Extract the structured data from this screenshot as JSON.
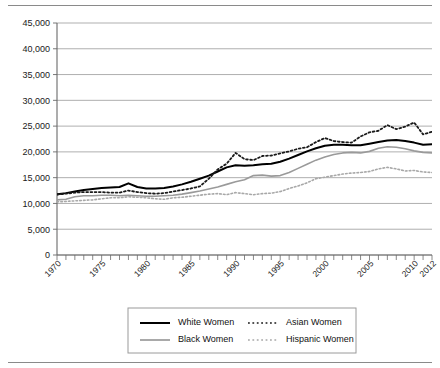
{
  "figure": {
    "background": "#ffffff",
    "has_top_rule": true,
    "has_bottom_rule": true,
    "rule_color": "#8a8a8a"
  },
  "chart_data": {
    "type": "line",
    "title": "",
    "subtitle": "",
    "xlabel": "",
    "ylabel": "",
    "xlim": [
      1970,
      2012
    ],
    "ylim": [
      0,
      45000
    ],
    "grid": true,
    "grid_axis": "y",
    "legend_position": "bottom",
    "yticks": [
      0,
      5000,
      10000,
      15000,
      20000,
      25000,
      30000,
      35000,
      40000,
      45000
    ],
    "ytick_labels": [
      "0",
      "5,000",
      "10,000",
      "15,000",
      "20,000",
      "25,000",
      "30,000",
      "35,000",
      "40,000",
      "45,000"
    ],
    "xticks": [
      1970,
      1975,
      1980,
      1985,
      1990,
      1995,
      2000,
      2005,
      2010,
      2012
    ],
    "xtick_labels": [
      "1970",
      "1975",
      "1980",
      "1985",
      "1990",
      "1995",
      "2000",
      "2005",
      "2010",
      "2012"
    ],
    "x": [
      1970,
      1971,
      1972,
      1973,
      1974,
      1975,
      1976,
      1977,
      1978,
      1979,
      1980,
      1981,
      1982,
      1983,
      1984,
      1985,
      1986,
      1987,
      1988,
      1989,
      1990,
      1991,
      1992,
      1993,
      1994,
      1995,
      1996,
      1997,
      1998,
      1999,
      2000,
      2001,
      2002,
      2003,
      2004,
      2005,
      2006,
      2007,
      2008,
      2009,
      2010,
      2011,
      2012
    ],
    "series": [
      {
        "name": "White Women",
        "color": "#000000",
        "style": "solid",
        "width": 2.0,
        "values": [
          11800,
          12000,
          12300,
          12600,
          12800,
          13000,
          13100,
          13200,
          13900,
          13200,
          12900,
          12900,
          13000,
          13300,
          13700,
          14200,
          14800,
          15400,
          16200,
          17000,
          17400,
          17300,
          17400,
          17600,
          17700,
          18100,
          18700,
          19400,
          20100,
          20700,
          21200,
          21400,
          21400,
          21300,
          21300,
          21600,
          21900,
          22200,
          22300,
          22100,
          21800,
          21400,
          21500
        ]
      },
      {
        "name": "Black Women",
        "color": "#9a9a9a",
        "style": "solid",
        "width": 1.6,
        "values": [
          10700,
          10800,
          11300,
          11500,
          11500,
          11600,
          11600,
          11500,
          11600,
          11500,
          11400,
          11400,
          11500,
          11600,
          11800,
          12100,
          12400,
          12800,
          13200,
          13700,
          14200,
          14600,
          15400,
          15500,
          15300,
          15400,
          16000,
          16800,
          17600,
          18400,
          19000,
          19500,
          19800,
          19900,
          19800,
          20100,
          20700,
          21000,
          20900,
          20600,
          20200,
          19900,
          19800
        ]
      },
      {
        "name": "Asian Women",
        "color": "#1a1a1a",
        "style": "dotted",
        "width": 1.8,
        "values": [
          11700,
          11900,
          12100,
          12200,
          12200,
          12200,
          12100,
          12100,
          12500,
          12200,
          12000,
          11900,
          12000,
          12300,
          12600,
          12900,
          13300,
          14800,
          16600,
          17700,
          19800,
          18600,
          18400,
          19200,
          19300,
          19700,
          20100,
          20600,
          20900,
          21900,
          22700,
          22100,
          21900,
          21800,
          23000,
          23800,
          24100,
          25200,
          24400,
          24900,
          25700,
          23400,
          23900
        ]
      },
      {
        "name": "Hispanic Women",
        "color": "#a8a8a8",
        "style": "dotted",
        "width": 1.6,
        "values": [
          10300,
          10400,
          10500,
          10600,
          10700,
          10900,
          11100,
          11100,
          11300,
          11200,
          11100,
          10900,
          10800,
          11100,
          11200,
          11400,
          11600,
          11800,
          11900,
          11700,
          12100,
          11900,
          11700,
          11900,
          12000,
          12300,
          12900,
          13400,
          14000,
          14800,
          15100,
          15400,
          15700,
          15900,
          16000,
          16200,
          16700,
          17000,
          16700,
          16300,
          16400,
          16100,
          16000
        ]
      }
    ]
  },
  "legend": {
    "entries": [
      {
        "label": "White Women",
        "color": "#000000",
        "style": "solid"
      },
      {
        "label": "Asian Women",
        "color": "#1a1a1a",
        "style": "dotted"
      },
      {
        "label": "Black Women",
        "color": "#9a9a9a",
        "style": "solid"
      },
      {
        "label": "Hispanic Women",
        "color": "#a8a8a8",
        "style": "dotted"
      }
    ]
  }
}
